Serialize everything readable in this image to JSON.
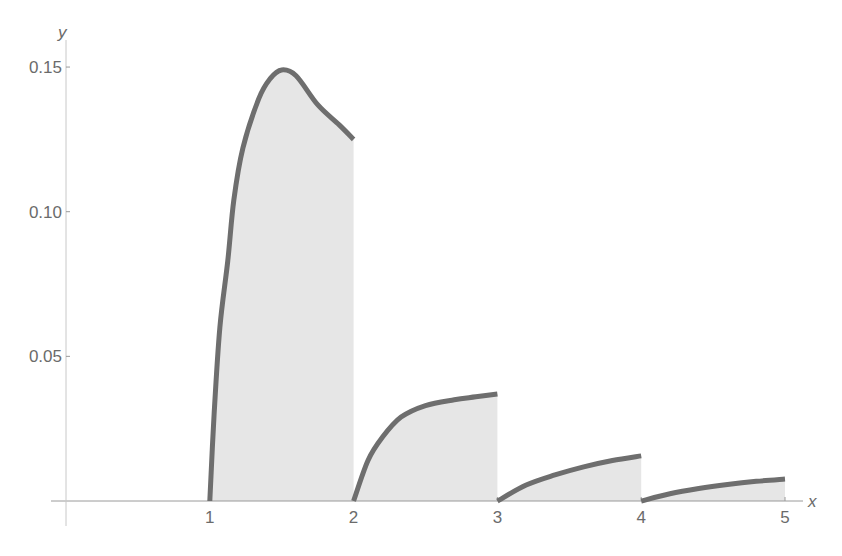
{
  "chart_data": {
    "type": "area",
    "title": "",
    "xlabel": "x",
    "ylabel": "y",
    "xlim": [
      0,
      5
    ],
    "ylim": [
      0,
      0.15
    ],
    "x_ticks": [
      1,
      2,
      3,
      4,
      5
    ],
    "x_tick_labels": [
      "1",
      "2",
      "3",
      "4",
      "5"
    ],
    "y_ticks": [
      0.05,
      0.1,
      0.15
    ],
    "y_tick_labels": [
      "0.05",
      "0.10",
      "0.15"
    ],
    "grid": false,
    "legend": null,
    "series": [
      {
        "name": "segment-1",
        "interval": [
          1,
          2
        ],
        "x": [
          1.0,
          1.03,
          1.07,
          1.125,
          1.167,
          1.23,
          1.34,
          1.42,
          1.5,
          1.6,
          1.75,
          1.9,
          2.0
        ],
        "y": [
          0.0,
          0.03,
          0.06,
          0.083,
          0.104,
          0.122,
          0.139,
          0.146,
          0.149,
          0.147,
          0.137,
          0.13,
          0.125
        ]
      },
      {
        "name": "segment-2",
        "interval": [
          2,
          3
        ],
        "x": [
          2.0,
          2.1,
          2.2,
          2.33,
          2.5,
          2.7,
          2.85,
          3.0
        ],
        "y": [
          0.0,
          0.014,
          0.022,
          0.029,
          0.033,
          0.035,
          0.036,
          0.037
        ]
      },
      {
        "name": "segment-3",
        "interval": [
          3,
          4
        ],
        "x": [
          3.0,
          3.2,
          3.4,
          3.6,
          3.8,
          4.0
        ],
        "y": [
          0.0,
          0.0055,
          0.009,
          0.0118,
          0.014,
          0.0156
        ]
      },
      {
        "name": "segment-4",
        "interval": [
          4,
          5
        ],
        "x": [
          4.0,
          4.2,
          4.4,
          4.6,
          4.8,
          5.0
        ],
        "y": [
          0.0,
          0.0025,
          0.0043,
          0.0057,
          0.0068,
          0.0076
        ]
      }
    ]
  },
  "colors": {
    "curve": "#6e6e6e",
    "fill": "#e6e6e6",
    "axis": "#9a9a9a",
    "text": "#6b6b6b"
  }
}
